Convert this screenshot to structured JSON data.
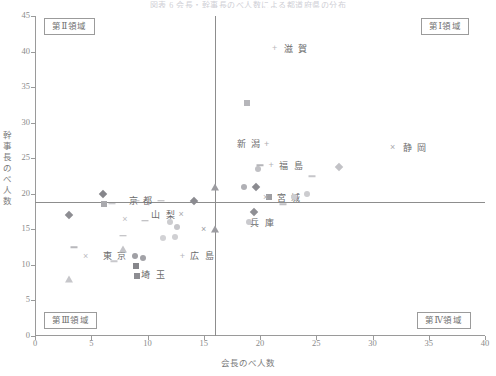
{
  "chart_data": {
    "type": "scatter",
    "title": "図表 6 会長・幹事長のべ人数による都道府県の分布",
    "xlabel": "会長のべ人数",
    "ylabel": "幹事長のべ人数",
    "xlim": [
      0,
      40
    ],
    "ylim": [
      0,
      45
    ],
    "xticks": [
      0,
      5,
      10,
      15,
      20,
      25,
      30,
      35,
      40
    ],
    "yticks": [
      0,
      5,
      10,
      15,
      20,
      25,
      30,
      35,
      40,
      45
    ],
    "grid": false,
    "legend": "none",
    "reference_lines": {
      "x": 16,
      "y": 15
    },
    "quadrants": [
      {
        "id": "q1",
        "label": "第Ⅰ領域",
        "corner": "top-right"
      },
      {
        "id": "q2",
        "label": "第Ⅱ領域",
        "corner": "top-left"
      },
      {
        "id": "q3",
        "label": "第Ⅲ領域",
        "corner": "bottom-left"
      },
      {
        "id": "q4",
        "label": "第Ⅳ領域",
        "corner": "bottom-right"
      }
    ],
    "points": [
      {
        "label": "滋 賀",
        "x": 21.3,
        "y": 40.5,
        "marker": "plus",
        "color": "#b9b9bd",
        "labeled": true,
        "label_dx": 9,
        "label_dy": 1
      },
      {
        "label": "静 岡",
        "x": 31.8,
        "y": 26.6,
        "marker": "cross",
        "color": "#a9a9ad",
        "labeled": true,
        "label_dx": 10,
        "label_dy": 1
      },
      {
        "label": "新 潟",
        "x": 20.6,
        "y": 27.0,
        "marker": "plus",
        "color": "#aeaeb2",
        "labeled": true,
        "label_dx": -30,
        "label_dy": 0
      },
      {
        "label": "福 島",
        "x": 21.0,
        "y": 24.0,
        "marker": "plus",
        "color": "#b2b2b6",
        "labeled": true,
        "label_dx": 8,
        "label_dy": 1
      },
      {
        "label": "宮 城",
        "x": 20.8,
        "y": 19.6,
        "marker": "square",
        "color": "#9e9ea2",
        "labeled": true,
        "label_dx": 8,
        "label_dy": 1
      },
      {
        "label": "兵 庫",
        "x": 19.5,
        "y": 17.5,
        "marker": "diamond",
        "color": "#8f8f94",
        "labeled": true,
        "label_dx": -4,
        "label_dy": 11
      },
      {
        "label": "京 都",
        "x": 11.2,
        "y": 19.0,
        "marker": "dash",
        "color": "#b4b4b8",
        "labeled": true,
        "label_dx": -32,
        "label_dy": 0
      },
      {
        "label": "山 梨",
        "x": 13.0,
        "y": 17.1,
        "marker": "cross",
        "color": "#aaaaae",
        "labeled": true,
        "label_dx": -30,
        "label_dy": 1
      },
      {
        "label": "東 京",
        "x": 8.9,
        "y": 11.3,
        "marker": "circle",
        "color": "#a0a0a5",
        "labeled": true,
        "label_dx": -32,
        "label_dy": 0
      },
      {
        "label": "埼 玉",
        "x": 9.0,
        "y": 9.9,
        "marker": "square",
        "color": "#86868b",
        "labeled": true,
        "label_dx": 5,
        "label_dy": 9
      },
      {
        "label": "広 島",
        "x": 13.1,
        "y": 11.2,
        "marker": "plus",
        "color": "#b6b6ba",
        "labeled": true,
        "label_dx": 8,
        "label_dy": 0
      },
      {
        "label": "",
        "x": 3.0,
        "y": 17.0,
        "marker": "diamond",
        "color": "#8d8d92",
        "labeled": false
      },
      {
        "label": "",
        "x": 6.0,
        "y": 20.0,
        "marker": "diamond",
        "color": "#86868b",
        "labeled": false
      },
      {
        "label": "",
        "x": 6.1,
        "y": 18.6,
        "marker": "square",
        "color": "#aaaaae",
        "labeled": false
      },
      {
        "label": "",
        "x": 6.8,
        "y": 18.6,
        "marker": "dash",
        "color": "#bdbdc1",
        "labeled": false
      },
      {
        "label": "",
        "x": 9.0,
        "y": 19.0,
        "marker": "dash",
        "color": "#c0c0c4",
        "labeled": false
      },
      {
        "label": "",
        "x": 14.1,
        "y": 19.0,
        "marker": "diamond",
        "color": "#8b8b90",
        "labeled": false
      },
      {
        "label": "",
        "x": 16.0,
        "y": 21.0,
        "marker": "tri",
        "color": "#9b9ba0",
        "labeled": false
      },
      {
        "label": "",
        "x": 8.0,
        "y": 16.4,
        "marker": "cross",
        "color": "#bcbcc0",
        "labeled": false
      },
      {
        "label": "",
        "x": 9.8,
        "y": 16.2,
        "marker": "dash",
        "color": "#b0b0b4",
        "labeled": false
      },
      {
        "label": "",
        "x": 12.0,
        "y": 16.0,
        "marker": "circle",
        "color": "#cccccf",
        "labeled": false
      },
      {
        "label": "",
        "x": 12.6,
        "y": 15.3,
        "marker": "circle",
        "color": "#c6c6ca",
        "labeled": false
      },
      {
        "label": "",
        "x": 15.0,
        "y": 15.0,
        "marker": "cross",
        "color": "#9d9da2",
        "labeled": false
      },
      {
        "label": "",
        "x": 16.0,
        "y": 15.0,
        "marker": "tri",
        "color": "#9b9ba0",
        "labeled": false
      },
      {
        "label": "",
        "x": 18.6,
        "y": 21.0,
        "marker": "circle",
        "color": "#b0b0b5",
        "labeled": false
      },
      {
        "label": "",
        "x": 19.6,
        "y": 21.0,
        "marker": "diamond",
        "color": "#8b8b90",
        "labeled": false
      },
      {
        "label": "",
        "x": 19.8,
        "y": 23.5,
        "marker": "circle",
        "color": "#c0c0c4",
        "labeled": false
      },
      {
        "label": "",
        "x": 20.0,
        "y": 24.0,
        "marker": "dash",
        "color": "#b5b5b9",
        "labeled": false
      },
      {
        "label": "",
        "x": 18.8,
        "y": 32.8,
        "marker": "square",
        "color": "#b6b6ba",
        "labeled": false
      },
      {
        "label": "",
        "x": 20.5,
        "y": 19.5,
        "marker": "cross",
        "color": "#b2b2b6",
        "labeled": false
      },
      {
        "label": "",
        "x": 22.0,
        "y": 18.5,
        "marker": "dash",
        "color": "#c0c0c4",
        "labeled": false
      },
      {
        "label": "",
        "x": 23.0,
        "y": 19.5,
        "marker": "circle",
        "color": "#cdcdd0",
        "labeled": false
      },
      {
        "label": "",
        "x": 24.2,
        "y": 20.0,
        "marker": "circle",
        "color": "#cccccf",
        "labeled": false
      },
      {
        "label": "",
        "x": 24.6,
        "y": 22.5,
        "marker": "dash",
        "color": "#c6c6ca",
        "labeled": false
      },
      {
        "label": "",
        "x": 27.0,
        "y": 23.8,
        "marker": "diamond",
        "color": "#c2c2c6",
        "labeled": false
      },
      {
        "label": "",
        "x": 19.0,
        "y": 16.0,
        "marker": "circle",
        "color": "#cacace",
        "labeled": false
      },
      {
        "label": "",
        "x": 3.5,
        "y": 12.5,
        "marker": "dash",
        "color": "#b8b8bc",
        "labeled": false
      },
      {
        "label": "",
        "x": 4.5,
        "y": 11.2,
        "marker": "cross",
        "color": "#bbbbc0",
        "labeled": false
      },
      {
        "label": "",
        "x": 3.0,
        "y": 8.0,
        "marker": "tri",
        "color": "#c6c6ca",
        "labeled": false
      },
      {
        "label": "",
        "x": 7.8,
        "y": 14.1,
        "marker": "dash",
        "color": "#b4b4b8",
        "labeled": false
      },
      {
        "label": "",
        "x": 7.8,
        "y": 12.2,
        "marker": "tri",
        "color": "#c4c4c8",
        "labeled": false
      },
      {
        "label": "",
        "x": 9.1,
        "y": 8.4,
        "marker": "square",
        "color": "#8d8d92",
        "labeled": false
      },
      {
        "label": "",
        "x": 11.4,
        "y": 13.8,
        "marker": "circle",
        "color": "#d2d2d5",
        "labeled": false
      },
      {
        "label": "",
        "x": 12.4,
        "y": 13.9,
        "marker": "circle",
        "color": "#d0d0d3",
        "labeled": false
      },
      {
        "label": "",
        "x": 9.6,
        "y": 11.0,
        "marker": "circle",
        "color": "#a2a2a7",
        "labeled": false
      },
      {
        "label": "",
        "x": 7.0,
        "y": 10.5,
        "marker": "dash",
        "color": "#c8c8cc",
        "labeled": false
      }
    ]
  }
}
